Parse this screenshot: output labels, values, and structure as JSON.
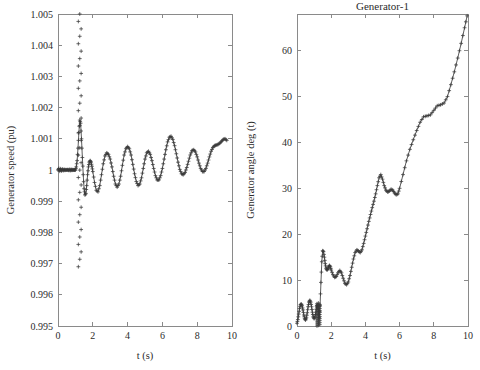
{
  "figure": {
    "background": "#ffffff",
    "line_color": "#4a4a4a",
    "marker_color": "#3a3a3a",
    "axis_color": "#8a8a8a"
  },
  "chart_data": [
    {
      "id": "generator-speed",
      "type": "line",
      "title": "",
      "xlabel": "t (s)",
      "ylabel": "Generator speed (pu)",
      "xlim": [
        0,
        10
      ],
      "ylim": [
        0.995,
        1.005
      ],
      "xticks": [
        0,
        2,
        4,
        6,
        8,
        10
      ],
      "xticklabels": [
        "0",
        "2",
        "4",
        "6",
        "8",
        "10"
      ],
      "yticks": [
        0.995,
        0.996,
        0.997,
        0.998,
        0.999,
        1,
        1.001,
        1.002,
        1.003,
        1.004,
        1.005
      ],
      "yticklabels": [
        "0.995",
        "0.996",
        "0.997",
        "0.998",
        "0.999",
        "1",
        "1.001",
        "1.002",
        "1.003",
        "1.004",
        "1.005"
      ],
      "grid": false,
      "legend": null,
      "marker": "+",
      "series": [
        {
          "name": "Generator speed (pu)",
          "x": [
            0.0,
            0.05,
            0.1,
            0.15,
            0.2,
            0.25,
            0.3,
            0.35,
            0.4,
            0.45,
            0.5,
            0.55,
            0.6,
            0.65,
            0.7,
            0.75,
            0.8,
            0.85,
            0.9,
            0.95,
            1.0,
            1.05,
            1.1,
            1.15,
            1.2,
            1.25,
            1.3,
            1.35,
            1.4,
            1.45,
            1.5,
            1.55,
            1.6,
            1.65,
            1.7,
            1.75,
            1.8,
            1.85,
            1.9,
            1.95,
            2.0,
            2.1,
            2.2,
            2.3,
            2.4,
            2.5,
            2.6,
            2.7,
            2.8,
            2.9,
            3.0,
            3.1,
            3.2,
            3.3,
            3.4,
            3.5,
            3.6,
            3.7,
            3.8,
            3.9,
            4.0,
            4.1,
            4.2,
            4.3,
            4.4,
            4.5,
            4.6,
            4.7,
            4.8,
            4.9,
            5.0,
            5.1,
            5.2,
            5.3,
            5.4,
            5.5,
            5.6,
            5.7,
            5.8,
            5.9,
            6.0,
            6.1,
            6.2,
            6.3,
            6.4,
            6.5,
            6.6,
            6.7,
            6.8,
            6.9,
            7.0,
            7.1,
            7.2,
            7.3,
            7.4,
            7.5,
            7.6,
            7.7,
            7.8,
            7.9,
            8.0,
            8.1,
            8.2,
            8.3,
            8.4,
            8.5,
            8.6,
            8.7,
            8.8,
            8.9,
            9.0,
            9.1,
            9.2,
            9.3,
            9.4,
            9.5,
            9.6,
            9.7,
            9.8,
            9.9,
            10.0
          ],
          "y": [
            1.0,
            1.00005,
            0.99996,
            1.00004,
            0.99997,
            1.00003,
            0.99998,
            1.00002,
            0.99999,
            1.00001,
            1.0,
            1.00001,
            0.99999,
            1.00002,
            0.99998,
            1.00002,
            0.99999,
            1.00001,
            1.0,
            1.0,
            1.0,
            1.0001,
            1.0003,
            1.0007,
            1.0012,
            1.0016,
            1.0015,
            1.001,
            1.0004,
            0.99985,
            0.9994,
            0.9992,
            0.99925,
            0.9995,
            0.99985,
            1.0001,
            1.00025,
            1.0003,
            1.00025,
            1.00012,
            0.99995,
            0.9996,
            0.99935,
            0.9993,
            0.9995,
            0.99985,
            1.0002,
            1.00045,
            1.00055,
            1.0005,
            1.00035,
            1.0001,
            0.9998,
            0.99955,
            0.99945,
            0.99955,
            0.9998,
            1.00015,
            1.00048,
            1.00068,
            1.00075,
            1.00068,
            1.00048,
            1.00018,
            0.99988,
            0.99963,
            0.9995,
            0.99955,
            0.99975,
            1.00005,
            1.00035,
            1.00055,
            1.0006,
            1.0005,
            1.0003,
            1.00005,
            0.99982,
            0.99968,
            0.99968,
            0.99982,
            1.00005,
            1.00035,
            1.00065,
            1.0009,
            1.00105,
            1.00108,
            1.00098,
            1.00078,
            1.00052,
            1.00025,
            1.00002,
            0.99988,
            0.99985,
            0.99992,
            1.00008,
            1.00028,
            1.00048,
            1.00062,
            1.00065,
            1.00058,
            1.00042,
            1.00022,
            1.00005,
            0.99995,
            0.99995,
            1.00005,
            1.00022,
            1.00042,
            1.0006,
            1.00072,
            1.00078,
            1.0008,
            1.00082,
            1.00086,
            1.00092,
            1.00098,
            1.001,
            1.00095
          ]
        }
      ],
      "transient_column": {
        "x": 1.25,
        "y_top": 1.005,
        "y_bottom": 0.9969,
        "note": "dense vertical spray of + markers at fault time"
      }
    },
    {
      "id": "generator-angle",
      "type": "line",
      "title": "Generator-1",
      "xlabel": "t (s)",
      "ylabel": "Generator angle deg (t)",
      "xlim": [
        0,
        10
      ],
      "ylim": [
        0,
        68
      ],
      "xticks": [
        0,
        2,
        4,
        6,
        8,
        10
      ],
      "xticklabels": [
        "0",
        "2",
        "4",
        "6",
        "8",
        "10"
      ],
      "yticks": [
        0,
        10,
        20,
        30,
        40,
        50,
        60
      ],
      "yticklabels": [
        "0",
        "10",
        "20",
        "30",
        "40",
        "50",
        "60"
      ],
      "grid": false,
      "legend": null,
      "marker": "+",
      "series": [
        {
          "name": "Generator angle deg (t)",
          "x": [
            0.0,
            0.05,
            0.1,
            0.15,
            0.2,
            0.25,
            0.3,
            0.35,
            0.4,
            0.45,
            0.5,
            0.55,
            0.6,
            0.65,
            0.7,
            0.75,
            0.8,
            0.85,
            0.9,
            0.95,
            1.0,
            1.05,
            1.1,
            1.15,
            1.2,
            1.25,
            1.3,
            1.35,
            1.4,
            1.45,
            1.5,
            1.55,
            1.6,
            1.65,
            1.7,
            1.75,
            1.8,
            1.85,
            1.9,
            1.95,
            2.0,
            2.1,
            2.2,
            2.3,
            2.4,
            2.5,
            2.6,
            2.7,
            2.8,
            2.9,
            3.0,
            3.1,
            3.2,
            3.3,
            3.4,
            3.5,
            3.6,
            3.7,
            3.8,
            3.9,
            4.0,
            4.1,
            4.2,
            4.3,
            4.4,
            4.5,
            4.6,
            4.7,
            4.8,
            4.9,
            5.0,
            5.1,
            5.2,
            5.3,
            5.4,
            5.5,
            5.6,
            5.7,
            5.8,
            5.9,
            6.0,
            6.2,
            6.4,
            6.6,
            6.8,
            7.0,
            7.2,
            7.4,
            7.6,
            7.8,
            8.0,
            8.2,
            8.4,
            8.6,
            8.8,
            9.0,
            9.2,
            9.4,
            9.6,
            9.8,
            9.95
          ],
          "y": [
            0.6,
            1.4,
            2.6,
            3.8,
            4.6,
            4.8,
            4.4,
            3.5,
            2.4,
            1.6,
            1.3,
            1.8,
            2.9,
            4.2,
            5.2,
            5.6,
            5.2,
            4.2,
            3.0,
            2.0,
            1.6,
            2.0,
            3.0,
            4.3,
            4.6,
            3.2,
            1.8,
            4.5,
            9.5,
            14.0,
            16.4,
            16.2,
            15.0,
            13.6,
            12.6,
            12.2,
            12.4,
            12.9,
            13.2,
            12.9,
            12.2,
            11.2,
            10.6,
            10.8,
            11.6,
            12.1,
            11.6,
            10.4,
            9.3,
            9.0,
            9.6,
            11.0,
            12.8,
            14.6,
            16.0,
            16.6,
            16.3,
            16.0,
            16.6,
            18.0,
            19.6,
            21.2,
            22.8,
            24.3,
            25.8,
            27.2,
            28.8,
            30.6,
            32.3,
            33.0,
            32.0,
            30.6,
            29.6,
            29.2,
            29.4,
            29.8,
            29.6,
            29.0,
            28.6,
            28.8,
            30.0,
            33.0,
            36.0,
            38.5,
            40.6,
            42.6,
            44.4,
            45.6,
            45.8,
            46.0,
            47.0,
            48.0,
            48.2,
            48.6,
            50.0,
            52.6,
            55.4,
            58.4,
            61.6,
            65.0,
            67.6
          ]
        }
      ],
      "transient_column": {
        "x": 1.25,
        "y_top": 5.0,
        "y_bottom": 0.0,
        "note": "dense cluster of + markers at fault time near zero"
      }
    }
  ]
}
